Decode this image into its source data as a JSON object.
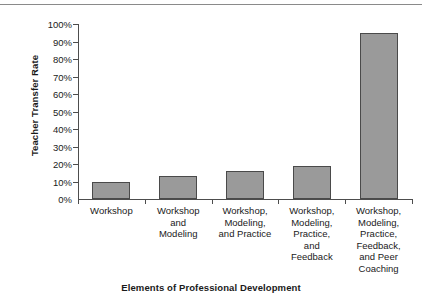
{
  "chart_data": {
    "type": "bar",
    "title": "",
    "subtitle": "",
    "xlabel": "Elements of Professional Development",
    "ylabel": "Teacher Transfer Rate",
    "categories": [
      "Workshop",
      "Workshop and Modeling",
      "Workshop, Modeling, and Practice",
      "Workshop, Modeling, Practice, and Feedback",
      "Workshop, Modeling, Practice, Feedback, and Peer Coaching"
    ],
    "category_lines": [
      [
        "Workshop"
      ],
      [
        "Workshop",
        "and",
        "Modeling"
      ],
      [
        "Workshop,",
        "Modeling,",
        "and Practice"
      ],
      [
        "Workshop,",
        "Modeling,",
        "Practice,",
        "and",
        "Feedback"
      ],
      [
        "Workshop,",
        "Modeling,",
        "Practice,",
        "Feedback,",
        "and Peer",
        "Coaching"
      ]
    ],
    "values": [
      10,
      13,
      16,
      19,
      95
    ],
    "value_labels": [
      "10%",
      "13%",
      "16%",
      "19%",
      "95%"
    ],
    "ylim": [
      0,
      100
    ],
    "ytick_labels": [
      "100%",
      "90%",
      "80%",
      "70%",
      "60%",
      "50%",
      "40%",
      "30%",
      "20%",
      "10%",
      "0%"
    ],
    "ytick_values": [
      100,
      90,
      80,
      70,
      60,
      50,
      40,
      30,
      20,
      10,
      0
    ],
    "grid": false,
    "legend": false,
    "legend_position": "none",
    "bar_color": "#9a9a9a",
    "bar_border_color": "#4a4a4a",
    "axis_color": "#4d4d4d"
  },
  "figure": {
    "top_rule_color": "#8a8a8a"
  }
}
